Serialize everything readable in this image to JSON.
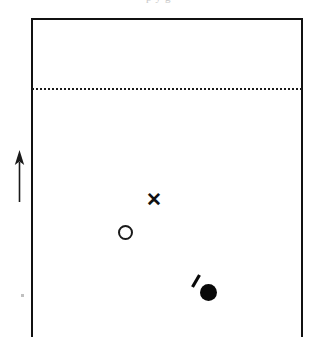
{
  "figure": {
    "clipped_caption": "p    y       g",
    "background_color": "#ffffff",
    "ink_color": "#111111",
    "width": 317,
    "height": 357
  },
  "frame": {
    "name": "plot-frame",
    "style": "open-bottom rectangle",
    "border_color": "#111111",
    "border_width": 2,
    "left": 31,
    "top": 18,
    "width": 272,
    "height": 319,
    "sides": [
      "left",
      "top",
      "right"
    ]
  },
  "dotted_line": {
    "name": "dotted-reference-line",
    "orientation": "horizontal",
    "color": "#1a1a1a",
    "y": 88,
    "x_start": 32,
    "x_end": 302,
    "style": "dotted"
  },
  "arrow": {
    "name": "up-arrow",
    "direction": "up",
    "color": "#1a1a1a",
    "x": 19,
    "y_top": 150,
    "y_bottom": 202
  },
  "markers": [
    {
      "id": "cross",
      "icon": "cross-marker-icon",
      "glyph": "✕",
      "shape": "cross",
      "fill": "solid",
      "color": "#111111",
      "cx": 153,
      "cy": 200,
      "size": 13
    },
    {
      "id": "open-circle",
      "icon": "open-circle-marker-icon",
      "glyph": "○",
      "shape": "circle",
      "fill": "none",
      "color": "#1a1a1a",
      "cx": 126,
      "cy": 233,
      "size": 15
    },
    {
      "id": "filled-circle",
      "icon": "filled-circle-marker-icon",
      "glyph": "●",
      "shape": "circle",
      "fill": "solid",
      "color": "#080808",
      "cx": 209,
      "cy": 293,
      "size": 17
    },
    {
      "id": "diagonal-tick",
      "icon": "diagonal-tick-icon",
      "glyph": "⁄",
      "shape": "slash",
      "fill": "solid",
      "color": "#080808",
      "cx": 196,
      "cy": 281,
      "size": 13
    }
  ],
  "artifact": {
    "name": "scan-speck",
    "x": 22,
    "y": 295,
    "color": "#c0c0c0"
  }
}
